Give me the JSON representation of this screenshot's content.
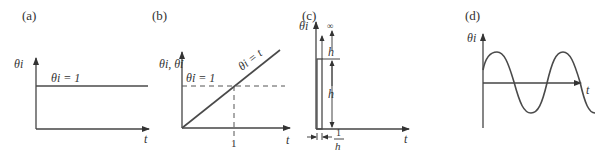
{
  "figure": {
    "panels": [
      {
        "id": "a",
        "label": "(a)",
        "y_axis_label": "θi",
        "x_axis_label": "t",
        "annotation": "θi = 1",
        "description": "step input"
      },
      {
        "id": "b",
        "label": "(b)",
        "y_axis_label": "θi, θ̇i",
        "x_axis_label": "t",
        "annotation_rate": "θ̇i = 1",
        "annotation_line": "θi = t",
        "x_tick": "1",
        "description": "ramp input"
      },
      {
        "id": "c",
        "label": "(c)",
        "y_axis_label": "θi",
        "x_axis_label": "t",
        "infinity": "∞",
        "height_label_top": "h",
        "height_label_mid": "h",
        "width_label_num": "1",
        "width_label_den": "h",
        "description": "impulse input"
      },
      {
        "id": "d",
        "label": "(d)",
        "y_axis_label": "θi",
        "x_axis_label": "t",
        "description": "sinusoidal input"
      }
    ]
  },
  "colors": {
    "line": "#444444",
    "text": "#333333",
    "background": "#ffffff"
  }
}
